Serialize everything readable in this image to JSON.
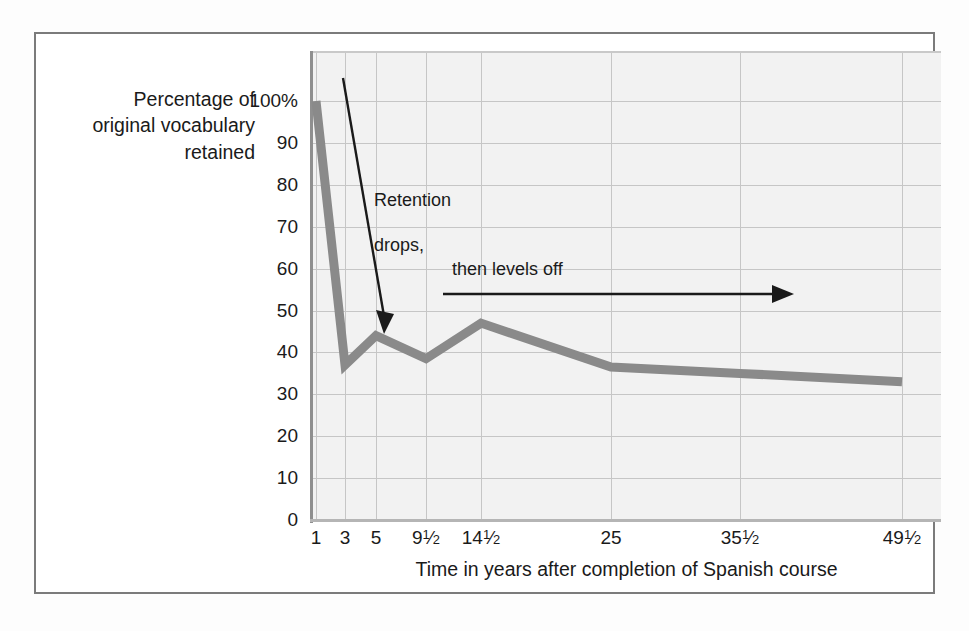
{
  "figure": {
    "background": "#ffffff",
    "frame_color": "#7b7b7b",
    "plot_background": "#f2f2f2",
    "grid_color": "#c6c6c6",
    "line_color": "#8a8a8a",
    "annotation_color": "#1a1a1a"
  },
  "chart_data": {
    "type": "line",
    "title": "",
    "xlabel": "Time in years after completion of Spanish course",
    "ylabel": "Percentage of original vocabulary retained",
    "ylim": [
      0,
      100
    ],
    "yticks": [
      "0",
      "10",
      "20",
      "30",
      "40",
      "50",
      "60",
      "70",
      "80",
      "90",
      "100%"
    ],
    "ytick_values": [
      0,
      10,
      20,
      30,
      40,
      50,
      60,
      70,
      80,
      90,
      100
    ],
    "categories": [
      "1",
      "3",
      "5",
      "9½",
      "14½",
      "25",
      "35½",
      "49½"
    ],
    "xtick_labels": [
      {
        "whole": "1",
        "num": "",
        "den": ""
      },
      {
        "whole": "3",
        "num": "",
        "den": ""
      },
      {
        "whole": "5",
        "num": "",
        "den": ""
      },
      {
        "whole": "9",
        "num": "1",
        "den": "2"
      },
      {
        "whole": "14",
        "num": "1",
        "den": "2"
      },
      {
        "whole": "25",
        "num": "",
        "den": ""
      },
      {
        "whole": "35",
        "num": "1",
        "den": "2"
      },
      {
        "whole": "49",
        "num": "1",
        "den": "2"
      }
    ],
    "values": [
      100,
      37,
      44,
      38.5,
      47,
      36.5,
      35,
      33
    ],
    "grid": true,
    "legend": "none",
    "series_name": "Percentage of original vocabulary retained"
  },
  "annotations": [
    {
      "id": "retention-drops",
      "text": "Retention\ndrops,",
      "arrow": "diagonal-down",
      "arrow_from": [
        343,
        78
      ],
      "arrow_to": [
        387,
        332
      ]
    },
    {
      "id": "then-levels-off",
      "text": "then levels off",
      "arrow": "horizontal-right",
      "arrow_from": [
        443,
        294
      ],
      "arrow_to": [
        790,
        294
      ]
    }
  ],
  "axis_captions": {
    "y": "Percentage of\noriginal vocabulary\nretained",
    "x": "Time in years after completion of Spanish course"
  }
}
